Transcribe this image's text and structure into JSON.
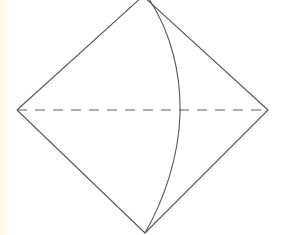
{
  "figure": {
    "background_color": "#ffffff",
    "edge_strip_color": "#fdfae2",
    "canvas": {
      "width": 281,
      "height": 235
    }
  },
  "style": {
    "stroke_color": "#585858",
    "stroke_width": 1.1,
    "dash_stroke_color": "#5c5c5c",
    "dash_pattern": "10 8",
    "dash_width": 1.2,
    "curve_stroke_color": "#585858",
    "curve_width": 1.1
  },
  "vertices": {
    "apex": {
      "label": "apex",
      "x": 143,
      "y": -4
    },
    "left": {
      "label": "left",
      "x": 17,
      "y": 110
    },
    "right": {
      "label": "right",
      "x": 268,
      "y": 110
    },
    "bottom": {
      "label": "bottom",
      "x": 145,
      "y": 233
    }
  },
  "geometry": {
    "outline_path": "M 143 -4 L 17 110 L 145 233 L 268 110 Z",
    "dashed_diagonal_path": "M 17 110 L 268 110",
    "curve_path": "M 147 -4 C 173 34, 181 78, 180 114 C 179 156, 164 200, 145 233"
  },
  "elements": {
    "outline_name": "rhombus-outline",
    "dashed_name": "dashed-horizontal-diagonal",
    "curve_name": "curved-edge-arc"
  }
}
